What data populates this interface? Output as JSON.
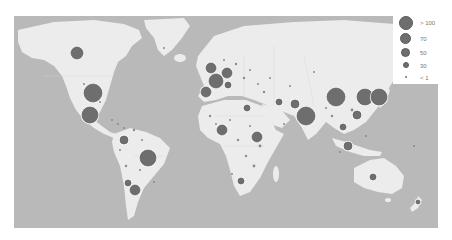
{
  "map": {
    "type": "bubble-map",
    "projection": "world",
    "colors": {
      "ocean": "#b9b9b9",
      "land": "#ececec",
      "bubble": "#6e6e6e",
      "bubble_stroke": "#555555"
    }
  },
  "legend": {
    "items": [
      {
        "label": "> 100",
        "radius": 7
      },
      {
        "label": "70",
        "radius": 5.5
      },
      {
        "label": "50",
        "radius": 4.5
      },
      {
        "label": "30",
        "radius": 3
      },
      {
        "label": "< 1",
        "radius": 1
      }
    ]
  },
  "bubbles": [
    {
      "region": "Canada",
      "x": 63,
      "y": 37,
      "r": 6
    },
    {
      "region": "United States",
      "x": 79,
      "y": 77,
      "r": 9
    },
    {
      "region": "Mexico",
      "x": 76,
      "y": 99,
      "r": 8
    },
    {
      "region": "Colombia",
      "x": 110,
      "y": 124,
      "r": 4
    },
    {
      "region": "Brazil",
      "x": 134,
      "y": 142,
      "r": 8
    },
    {
      "region": "Chile",
      "x": 114,
      "y": 167,
      "r": 3
    },
    {
      "region": "Argentina",
      "x": 121,
      "y": 174,
      "r": 5
    },
    {
      "region": "United Kingdom",
      "x": 197,
      "y": 52,
      "r": 5
    },
    {
      "region": "Germany",
      "x": 213,
      "y": 57,
      "r": 5
    },
    {
      "region": "France",
      "x": 202,
      "y": 65,
      "r": 7
    },
    {
      "region": "Spain",
      "x": 192,
      "y": 76,
      "r": 5
    },
    {
      "region": "Italy",
      "x": 214,
      "y": 69,
      "r": 3
    },
    {
      "region": "Egypt",
      "x": 233,
      "y": 92,
      "r": 3
    },
    {
      "region": "Nigeria",
      "x": 208,
      "y": 114,
      "r": 5
    },
    {
      "region": "Ethiopia",
      "x": 243,
      "y": 121,
      "r": 5
    },
    {
      "region": "South Africa",
      "x": 227,
      "y": 165,
      "r": 3
    },
    {
      "region": "Iran",
      "x": 265,
      "y": 86,
      "r": 3
    },
    {
      "region": "Pakistan",
      "x": 281,
      "y": 88,
      "r": 4
    },
    {
      "region": "India",
      "x": 292,
      "y": 100,
      "r": 9
    },
    {
      "region": "China",
      "x": 322,
      "y": 81,
      "r": 9
    },
    {
      "region": "South Korea",
      "x": 351,
      "y": 81,
      "r": 8
    },
    {
      "region": "Japan",
      "x": 365,
      "y": 81,
      "r": 8
    },
    {
      "region": "Philippines",
      "x": 343,
      "y": 99,
      "r": 4
    },
    {
      "region": "Vietnam",
      "x": 329,
      "y": 111,
      "r": 3
    },
    {
      "region": "Indonesia",
      "x": 334,
      "y": 130,
      "r": 4
    },
    {
      "region": "Australia",
      "x": 359,
      "y": 161,
      "r": 3
    },
    {
      "region": "New Zealand",
      "x": 404,
      "y": 186,
      "r": 2
    }
  ]
}
